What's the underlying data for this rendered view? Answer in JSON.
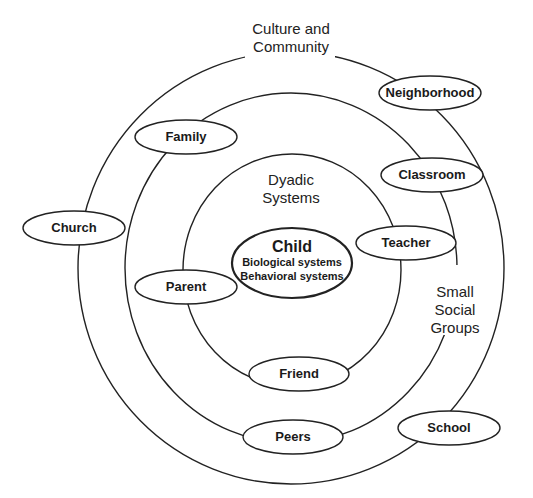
{
  "diagram": {
    "type": "nested-systems",
    "rings": {
      "outer": {
        "label_line1": "Culture and",
        "label_line2": "Community"
      },
      "middle": {
        "label_line1": "Small",
        "label_line2": "Social",
        "label_line3": "Groups"
      },
      "inner": {
        "label_line1": "Dyadic",
        "label_line2": "Systems"
      }
    },
    "center": {
      "title": "Child",
      "line1": "Biological systems",
      "line2": "Behavioral systems"
    },
    "nodes": {
      "neighborhood": "Neighborhood",
      "family": "Family",
      "classroom": "Classroom",
      "church": "Church",
      "teacher": "Teacher",
      "parent": "Parent",
      "friend": "Friend",
      "peers": "Peers",
      "school": "School"
    },
    "colors": {
      "stroke": "#222222",
      "background": "#ffffff"
    }
  }
}
